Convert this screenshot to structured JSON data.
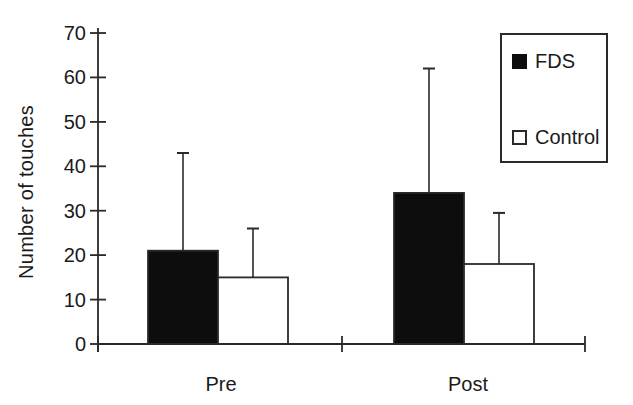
{
  "figure": {
    "background": "#ffffff",
    "line_color": "#2a2a2a",
    "text_color": "#1a1a1a",
    "bar_fill_fds": "#0d0d0d",
    "bar_fill_control": "#ffffff"
  },
  "chart_data": {
    "type": "bar",
    "title": "",
    "xlabel": "",
    "ylabel": "Number of touches",
    "categories": [
      "Pre",
      "Post"
    ],
    "series": [
      {
        "name": "FDS",
        "swatch": "filled-black-square",
        "fill": "#0d0d0d",
        "values": [
          21,
          34
        ],
        "error_upper": [
          22,
          28
        ],
        "error_top": [
          43,
          62
        ]
      },
      {
        "name": "Control",
        "swatch": "open-white-square",
        "fill": "#ffffff",
        "values": [
          15,
          18
        ],
        "error_upper": [
          11,
          11.5
        ],
        "error_top": [
          26,
          29.5
        ]
      }
    ],
    "ylim": [
      0,
      70
    ],
    "yticks": [
      0,
      10,
      20,
      30,
      40,
      50,
      60,
      70
    ],
    "grid": false,
    "legend_position": "upper right",
    "error_bars": "upper whisker with cap only",
    "bar_style": "grouped, adjacent bars, black outline"
  }
}
